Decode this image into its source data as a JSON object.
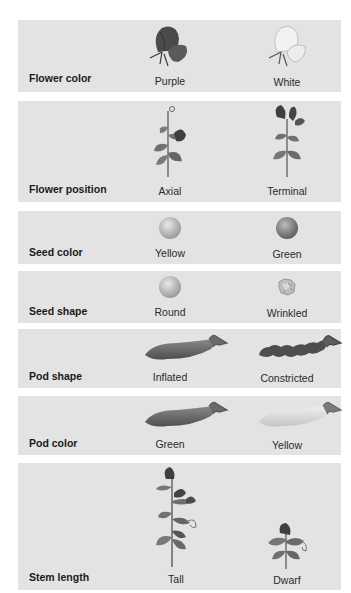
{
  "rows": [
    {
      "trait": "Flower color",
      "dominant": {
        "label": "Purple",
        "icon": "purple-flower-icon"
      },
      "recessive": {
        "label": "White",
        "icon": "white-flower-icon"
      }
    },
    {
      "trait": "Flower position",
      "dominant": {
        "label": "Axial",
        "icon": "axial-flower-plant-icon"
      },
      "recessive": {
        "label": "Terminal",
        "icon": "terminal-flower-plant-icon"
      }
    },
    {
      "trait": "Seed color",
      "dominant": {
        "label": "Yellow",
        "icon": "yellow-seed-icon"
      },
      "recessive": {
        "label": "Green",
        "icon": "green-seed-icon"
      }
    },
    {
      "trait": "Seed shape",
      "dominant": {
        "label": "Round",
        "icon": "round-seed-icon"
      },
      "recessive": {
        "label": "Wrinkled",
        "icon": "wrinkled-seed-icon"
      }
    },
    {
      "trait": "Pod shape",
      "dominant": {
        "label": "Inflated",
        "icon": "inflated-pod-icon"
      },
      "recessive": {
        "label": "Constricted",
        "icon": "constricted-pod-icon"
      }
    },
    {
      "trait": "Pod color",
      "dominant": {
        "label": "Green",
        "icon": "green-pod-icon"
      },
      "recessive": {
        "label": "Yellow",
        "icon": "yellow-pod-icon"
      }
    },
    {
      "trait": "Stem length",
      "dominant": {
        "label": "Tall",
        "icon": "tall-plant-icon"
      },
      "recessive": {
        "label": "Dwarf",
        "icon": "dwarf-plant-icon"
      }
    }
  ],
  "colors": {
    "panel": "#e3e3e3",
    "text": "#1a1a1a"
  }
}
